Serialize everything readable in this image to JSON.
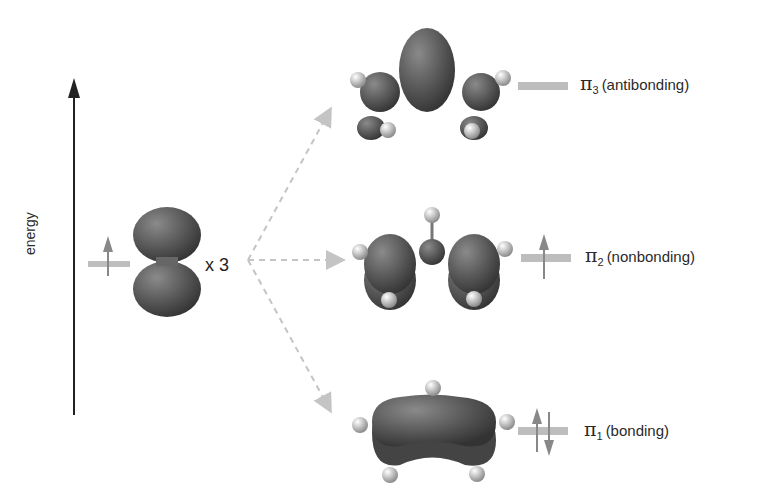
{
  "axis": {
    "label": "energy"
  },
  "atomic_orbital": {
    "multiplier": "x 3",
    "electrons": "up"
  },
  "molecular_orbitals": [
    {
      "symbol": "π",
      "index": "3",
      "type": "(antibonding)",
      "electrons": "none"
    },
    {
      "symbol": "π",
      "index": "2",
      "type": "(nonbonding)",
      "electrons": "up"
    },
    {
      "symbol": "π",
      "index": "1",
      "type": "(bonding)",
      "electrons": "up-down"
    }
  ],
  "colors": {
    "lobe": "#555555",
    "level": "#bdbdbd",
    "arrow": "#888888",
    "dashed": "#c4c4c4",
    "hydrogen": "#dddddd"
  }
}
